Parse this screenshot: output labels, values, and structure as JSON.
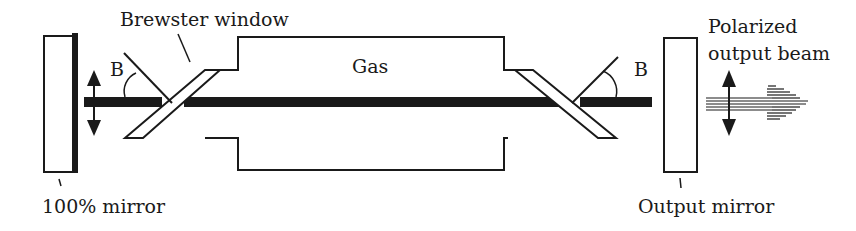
{
  "diagram": {
    "labels": {
      "brewster_window": "Brewster window",
      "gas": "Gas",
      "angle_left": "B",
      "angle_right": "B",
      "mirror_left": "100% mirror",
      "mirror_right": "Output mirror",
      "output_beam_line1": "Polarized",
      "output_beam_line2": "output beam"
    },
    "colors": {
      "stroke": "#1a1a1a",
      "background": "#ffffff"
    }
  }
}
